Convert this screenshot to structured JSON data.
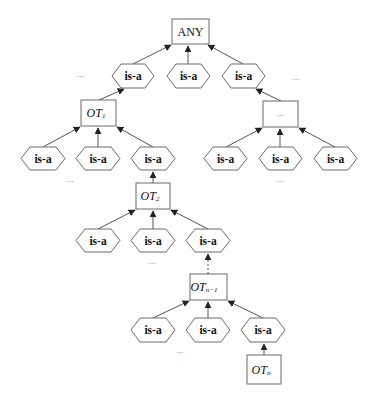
{
  "diagram": {
    "title": "",
    "root": {
      "label": "ANY"
    },
    "relation_label": "is-a",
    "ellipsis": "...",
    "nodes": {
      "any": {
        "label": "ANY"
      },
      "ot1": {
        "base": "OT",
        "sub": "1"
      },
      "ot2": {
        "base": "OT",
        "sub": "2"
      },
      "otn1": {
        "base": "OT",
        "sub": "n−1"
      },
      "otn": {
        "base": "OT",
        "sub": "n"
      },
      "unknown": {
        "label": "..."
      }
    },
    "levels": [
      {
        "parent": "ANY",
        "relations": [
          "is-a",
          "is-a",
          "is-a"
        ]
      },
      {
        "parent": "OT1",
        "relations": [
          "is-a",
          "is-a",
          "is-a"
        ]
      },
      {
        "parent": "...",
        "relations": [
          "is-a",
          "is-a",
          "is-a"
        ]
      },
      {
        "parent": "OT2",
        "relations": [
          "is-a",
          "is-a",
          "is-a"
        ]
      },
      {
        "parent": "OTn-1",
        "relations": [
          "is-a",
          "is-a",
          "is-a"
        ]
      }
    ],
    "colors": {
      "stroke": "#6b6b6b",
      "text": "#111111",
      "background": "#ffffff"
    }
  }
}
